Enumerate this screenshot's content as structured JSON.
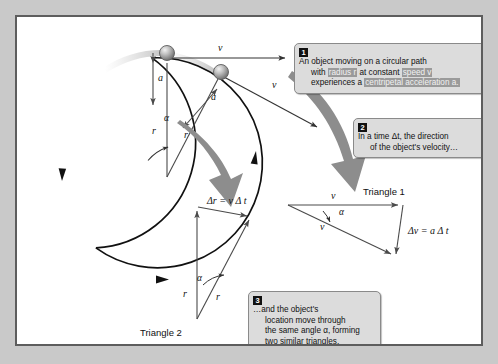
{
  "figure": {
    "frame_color": "#5d5d5d",
    "background_color": "#c9c9c9",
    "canvas_color": "#ffffff",
    "ink_color": "#111111",
    "vector_color": "#555555",
    "swoosh_color": "#8d8d8d",
    "highlight_color": "#9a9a9a"
  },
  "callouts": [
    {
      "number": "1",
      "lines": [
        [
          {
            "t": "An object moving on a circular path",
            "hl": false
          }
        ],
        [
          {
            "t": "with ",
            "hl": false
          },
          {
            "t": "radius r",
            "hl": true
          },
          {
            "t": " at constant ",
            "hl": false
          },
          {
            "t": "speed v",
            "hl": true
          }
        ],
        [
          {
            "t": "experiences a ",
            "hl": false
          },
          {
            "t": "centripetal acceleration a.",
            "hl": true
          }
        ]
      ]
    },
    {
      "number": "2",
      "lines": [
        [
          {
            "t": "In a time Δt, the direction",
            "hl": false
          }
        ],
        [
          {
            "t": "of the object's velocity…",
            "hl": false
          }
        ]
      ]
    },
    {
      "number": "3",
      "lines": [
        [
          {
            "t": "…and the object's",
            "hl": false
          }
        ],
        [
          {
            "t": "location move through",
            "hl": false
          }
        ],
        [
          {
            "t": "the same angle α, forming",
            "hl": false
          }
        ],
        [
          {
            "t": "two similar triangles.",
            "hl": false
          }
        ]
      ]
    }
  ],
  "circle_diagram": {
    "velocity_top_label": "v",
    "velocity_second_label": "v",
    "acceleration_top_label": "a",
    "acceleration_second_label": "a",
    "radius_vertical_label": "r",
    "radius_angled_label": "r",
    "angle_label": "α"
  },
  "triangle_1": {
    "caption": "Triangle 1",
    "side_top_label": "v",
    "side_lower_label": "v",
    "angle_label": "α",
    "delta_label": "Δv = a Δ t"
  },
  "triangle_2": {
    "caption": "Triangle 2",
    "top_label": "Δr = v Δ t",
    "side_left_label": "r",
    "side_right_label": "r",
    "angle_label": "α"
  },
  "chart_data": {
    "type": "diagram",
    "elements": [
      {
        "name": "circular-path",
        "center": [
          150,
          160
        ],
        "radius": 105,
        "direction": "clockwise"
      },
      {
        "name": "object-position-1",
        "at": [
          150,
          55
        ]
      },
      {
        "name": "object-position-2",
        "at": [
          204,
          70
        ]
      },
      {
        "name": "velocity-vector-1",
        "from": [
          150,
          55
        ],
        "to": [
          271,
          55
        ],
        "label": "v"
      },
      {
        "name": "velocity-vector-2",
        "from": [
          204,
          70
        ],
        "to": [
          300,
          122
        ],
        "label": "v"
      },
      {
        "name": "acceleration-vector-1",
        "from": [
          150,
          55
        ],
        "to": [
          150,
          95
        ],
        "label": "a"
      },
      {
        "name": "acceleration-vector-2",
        "from": [
          204,
          70
        ],
        "to": [
          178,
          100
        ],
        "label": "a"
      },
      {
        "name": "radius-vector-vertical",
        "from": [
          150,
          160
        ],
        "to": [
          150,
          55
        ],
        "label": "r"
      },
      {
        "name": "radius-vector-angled",
        "from": [
          150,
          160
        ],
        "to": [
          204,
          70
        ],
        "label": "r"
      },
      {
        "name": "angle-alpha-circle",
        "vertex": [
          150,
          160
        ],
        "label": "α"
      },
      {
        "name": "triangle-1-velocity-triangle",
        "label": "Triangle 1"
      },
      {
        "name": "triangle-2-displacement-triangle",
        "label": "Triangle 2"
      }
    ]
  }
}
